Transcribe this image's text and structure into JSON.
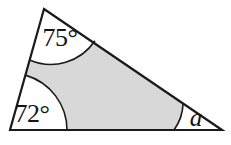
{
  "figure": {
    "name": "triangle-angles-diagram",
    "shape": "triangle",
    "background_color": "#ffffff",
    "fill_color": "#d8d8d8",
    "stroke_color": "#1a1a1a",
    "arc_fill_color": "#ffffff",
    "stroke_width": 2,
    "vertices": {
      "top": {
        "x": 44,
        "y": 9
      },
      "bottom_left": {
        "x": 10,
        "y": 130
      },
      "bottom_right": {
        "x": 222,
        "y": 130
      }
    },
    "angles": [
      {
        "id": "top-angle",
        "label": "75°",
        "value": 75,
        "unit": "degrees",
        "vertex": "top",
        "arc_radius": 52,
        "label_x": 60,
        "label_y": 46
      },
      {
        "id": "bottom-left-angle",
        "label": "72°",
        "value": 72,
        "unit": "degrees",
        "vertex": "bottom_left",
        "arc_radius": 57,
        "label_x": 32,
        "label_y": 122
      },
      {
        "id": "bottom-right-angle",
        "label": "a",
        "value": null,
        "unit": "degrees",
        "vertex": "bottom_right",
        "arc_radius": 48,
        "label_x": 196,
        "label_y": 126
      }
    ]
  }
}
